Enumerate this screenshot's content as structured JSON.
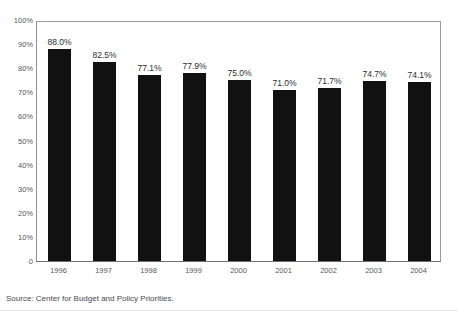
{
  "chart_data": {
    "type": "bar",
    "title": "",
    "xlabel": "",
    "ylabel": "",
    "categories": [
      "1996",
      "1997",
      "1998",
      "1999",
      "2000",
      "2001",
      "2002",
      "2003",
      "2004"
    ],
    "values": [
      88.0,
      82.5,
      77.1,
      77.9,
      75.0,
      71.0,
      71.7,
      74.7,
      74.1
    ],
    "data_labels": [
      "88.0%",
      "82.5%",
      "77.1%",
      "77.9%",
      "75.0%",
      "71.0%",
      "71.7%",
      "74.7%",
      "74.1%"
    ],
    "ylim": [
      0,
      100
    ],
    "y_ticks": [
      100,
      90,
      80,
      70,
      60,
      50,
      40,
      30,
      20,
      10,
      0
    ],
    "y_tick_labels": [
      "100%",
      "90%",
      "80%",
      "70%",
      "60%",
      "50%",
      "40%",
      "30%",
      "20%",
      "10%",
      "0"
    ],
    "grid": false,
    "legend": false,
    "legend_position": "none",
    "bar_color": "#111111",
    "axis_color": "#8d8d92",
    "text_color": "#56565b"
  },
  "title_remnant": "",
  "source": {
    "text": "Source: Center for Budget and Policy Priorities."
  }
}
